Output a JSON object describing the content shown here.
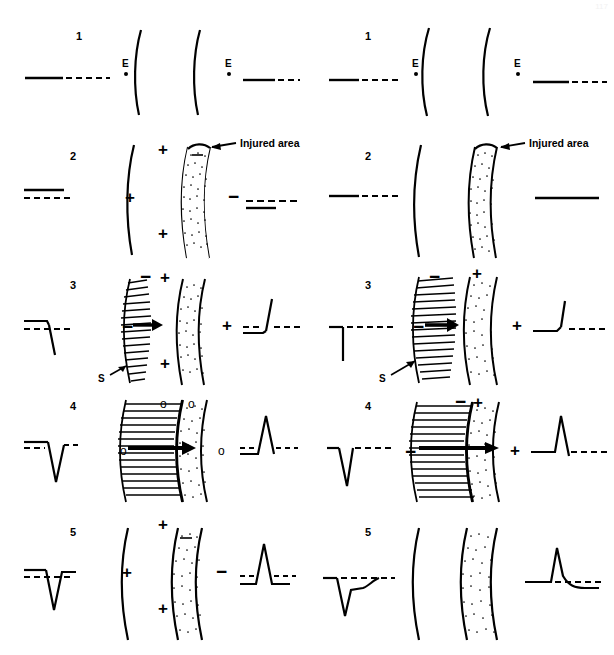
{
  "figure": {
    "page_mark": "117",
    "panel_count": 2,
    "row_count": 5,
    "colors": {
      "ink": "#000000",
      "background": "#ffffff",
      "injured_area_fill": "#ffffff",
      "injured_area_stipple": "#000000"
    },
    "legend_symbols": {
      "plus": "+",
      "minus": "−",
      "zero": "o",
      "electrode": "E",
      "stimulus": "S"
    }
  },
  "panels": [
    {
      "id": "left",
      "name": "left-panel",
      "rows": [
        {
          "number": "1",
          "electrode_label": "E",
          "ecg_left": "flat baseline, solid then dashed",
          "ecg_right": "flat baseline, solid then dashed",
          "signs_left": [],
          "signs_right": [],
          "annotation": "",
          "stimulus_label": "",
          "has_wavefront": false,
          "has_injured_area": false
        },
        {
          "number": "2",
          "electrode_label": "",
          "ecg_left": "ST elevation: solid line above dashed baseline",
          "ecg_right": "ST depression: solid line with dashed baseline",
          "signs_left": [
            "+",
            "+",
            "+"
          ],
          "signs_right": [
            "−"
          ],
          "annotation": "Injured area",
          "stimulus_label": "",
          "has_wavefront": false,
          "has_injured_area": true
        },
        {
          "number": "3",
          "electrode_label": "",
          "ecg_left": "downward deflection from elevated ST",
          "ecg_right": "upward deflection from depressed ST",
          "signs_left": [
            "−",
            "−",
            "+",
            "+"
          ],
          "signs_right": [
            "+"
          ],
          "annotation": "",
          "stimulus_label": "S",
          "has_wavefront": true,
          "has_injured_area": true
        },
        {
          "number": "4",
          "electrode_label": "",
          "ecg_left": "deep negative QS deflection",
          "ecg_right": "tall positive R deflection",
          "signs_left": [
            "o",
            "o",
            "o"
          ],
          "signs_right": [
            "o"
          ],
          "annotation": "",
          "stimulus_label": "",
          "has_wavefront": true,
          "has_injured_area": true
        },
        {
          "number": "5",
          "electrode_label": "",
          "ecg_left": "QS complex returning to elevated ST",
          "ecg_right": "R wave with depressed ST",
          "signs_left": [
            "+",
            "+",
            "+"
          ],
          "signs_right": [
            "−"
          ],
          "annotation": "",
          "stimulus_label": "",
          "has_wavefront": false,
          "has_injured_area": true
        }
      ]
    },
    {
      "id": "right",
      "name": "right-panel",
      "rows": [
        {
          "number": "1",
          "electrode_label": "E",
          "ecg_left": "flat baseline, solid then dashed",
          "ecg_right": "flat baseline, solid then dashed",
          "signs_left": [],
          "signs_right": [],
          "annotation": "",
          "stimulus_label": "",
          "has_wavefront": false,
          "has_injured_area": false
        },
        {
          "number": "2",
          "electrode_label": "",
          "ecg_left": "flat isoelectric baseline",
          "ecg_right": "flat isoelectric baseline",
          "signs_left": [],
          "signs_right": [],
          "annotation": "Injured area",
          "stimulus_label": "",
          "has_wavefront": false,
          "has_injured_area": true
        },
        {
          "number": "3",
          "electrode_label": "",
          "ecg_left": "downward deflection on baseline",
          "ecg_right": "upward deflection on baseline",
          "signs_left": [
            "−",
            "−"
          ],
          "signs_right": [
            "+",
            "+"
          ],
          "annotation": "",
          "stimulus_label": "S",
          "has_wavefront": true,
          "has_injured_area": true
        },
        {
          "number": "4",
          "electrode_label": "",
          "ecg_left": "deep negative QS deflection",
          "ecg_right": "tall positive R deflection",
          "signs_left": [
            "−",
            "−"
          ],
          "signs_right": [
            "+",
            "+"
          ],
          "annotation": "",
          "stimulus_label": "",
          "has_wavefront": true,
          "has_injured_area": true
        },
        {
          "number": "5",
          "electrode_label": "",
          "ecg_left": "QS with elevated recovery segment",
          "ecg_right": "R wave with rounded descending segment",
          "signs_left": [],
          "signs_right": [],
          "annotation": "",
          "stimulus_label": "",
          "has_wavefront": false,
          "has_injured_area": true
        }
      ]
    }
  ]
}
